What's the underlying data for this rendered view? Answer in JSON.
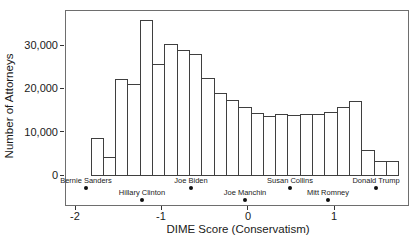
{
  "chart_data": {
    "type": "bar",
    "subtype": "histogram",
    "title": "",
    "xlabel": "DIME Score (Conservatism)",
    "ylabel": "Number of Attorneys",
    "x_ticks": [
      {
        "value": -2,
        "label": "-2"
      },
      {
        "value": -1,
        "label": "-1"
      },
      {
        "value": 0,
        "label": "0"
      },
      {
        "value": 1,
        "label": "1"
      }
    ],
    "y_ticks": [
      {
        "value": 0,
        "label": "0"
      },
      {
        "value": 10000,
        "label": "10,000"
      },
      {
        "value": 20000,
        "label": "20,000"
      },
      {
        "value": 30000,
        "label": "30,000"
      }
    ],
    "xlim": [
      -2.12,
      1.87
    ],
    "ylim": [
      -6900,
      38100
    ],
    "grid": {
      "major": true,
      "minor": true,
      "major_color": "#d9d9d9",
      "minor_color": "#ececec"
    },
    "minor_y_values": [
      -5000,
      5000,
      15000,
      25000,
      35000
    ],
    "minor_x_values": [
      -1.5,
      -0.5,
      0.5,
      1.5
    ],
    "bar_fill": "#ffffff",
    "bar_outline": "#3f3f3f",
    "bin_edges": [
      -1.82,
      -1.678,
      -1.535,
      -1.393,
      -1.25,
      -1.108,
      -0.965,
      -0.823,
      -0.68,
      -0.538,
      -0.395,
      -0.253,
      -0.11,
      0.033,
      0.175,
      0.318,
      0.46,
      0.603,
      0.745,
      0.888,
      1.03,
      1.173,
      1.315,
      1.458,
      1.6,
      1.743
    ],
    "counts": [
      8500,
      4200,
      22200,
      21000,
      35800,
      25600,
      30300,
      28900,
      27900,
      22300,
      19000,
      17300,
      15800,
      14400,
      13600,
      14200,
      13800,
      14100,
      14000,
      14600,
      15800,
      17100,
      5800,
      3300,
      3200
    ],
    "annotations": [
      {
        "name": "Bernie Sanders",
        "score": -1.87,
        "row": 1
      },
      {
        "name": "Hillary Clinton",
        "score": -1.22,
        "row": 2
      },
      {
        "name": "Joe Biden",
        "score": -0.66,
        "row": 1
      },
      {
        "name": "Joe Manchin",
        "score": -0.03,
        "row": 2
      },
      {
        "name": "Susan Collins",
        "score": 0.49,
        "row": 1
      },
      {
        "name": "Mitt Romney",
        "score": 0.93,
        "row": 2
      },
      {
        "name": "Donald Trump",
        "score": 1.49,
        "row": 1
      }
    ]
  }
}
